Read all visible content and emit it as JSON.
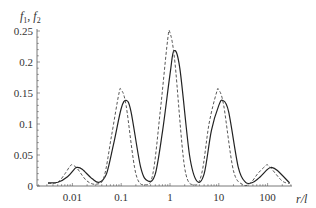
{
  "chart_data": {
    "type": "line",
    "title": "",
    "ylabel": "f1, f2",
    "ylabel_parts": {
      "a": "f",
      "a_sub": "1",
      "sep": ", ",
      "b": "f",
      "b_sub": "2"
    },
    "xlabel": "r/l",
    "xscale": "log",
    "xlim": [
      0.003,
      280
    ],
    "ylim": [
      0,
      0.25
    ],
    "grid": false,
    "legend": null,
    "x_ticks": [
      {
        "value": 0.01,
        "label": "0.01"
      },
      {
        "value": 0.1,
        "label": "0.1"
      },
      {
        "value": 1,
        "label": "1"
      },
      {
        "value": 10,
        "label": "10"
      },
      {
        "value": 100,
        "label": "100"
      }
    ],
    "y_ticks": [
      {
        "value": 0,
        "label": "0"
      },
      {
        "value": 0.05,
        "label": "0.05"
      },
      {
        "value": 0.1,
        "label": "0.1"
      },
      {
        "value": 0.15,
        "label": "0.15"
      },
      {
        "value": 0.2,
        "label": "0.2"
      },
      {
        "value": 0.25,
        "label": "0.25"
      }
    ],
    "series": [
      {
        "name": "f1",
        "style": "solid",
        "color": "#222222",
        "peaks": [
          {
            "r": 0.012,
            "value": 0.03
          },
          {
            "r": 0.13,
            "value": 0.138
          },
          {
            "r": 1.2,
            "value": 0.218
          },
          {
            "r": 12,
            "value": 0.138
          },
          {
            "r": 120,
            "value": 0.03
          }
        ],
        "x_log": [
          -2.5,
          -2.3,
          -2.1,
          -1.95,
          -1.9,
          -1.8,
          -1.6,
          -1.45,
          -1.3,
          -1.15,
          -1.0,
          -0.9,
          -0.8,
          -0.6,
          -0.45,
          -0.3,
          -0.15,
          0.0,
          0.08,
          0.2,
          0.4,
          0.55,
          0.7,
          0.85,
          1.0,
          1.08,
          1.2,
          1.4,
          1.55,
          1.7,
          1.85,
          2.0,
          2.08,
          2.2,
          2.45
        ],
        "y": [
          0.005,
          0.006,
          0.015,
          0.028,
          0.03,
          0.027,
          0.012,
          0.006,
          0.02,
          0.07,
          0.125,
          0.138,
          0.12,
          0.03,
          0.008,
          0.02,
          0.09,
          0.18,
          0.218,
          0.19,
          0.05,
          0.008,
          0.02,
          0.09,
          0.13,
          0.138,
          0.12,
          0.03,
          0.006,
          0.006,
          0.015,
          0.027,
          0.03,
          0.025,
          0.005
        ]
      },
      {
        "name": "f2",
        "style": "dashed",
        "color": "#444444",
        "peaks": [
          {
            "r": 0.01,
            "value": 0.034
          },
          {
            "r": 0.1,
            "value": 0.155
          },
          {
            "r": 1.0,
            "value": 0.247
          },
          {
            "r": 10,
            "value": 0.155
          },
          {
            "r": 100,
            "value": 0.034
          }
        ],
        "x_log": [
          -2.5,
          -2.3,
          -2.15,
          -2.05,
          -2.0,
          -1.9,
          -1.7,
          -1.5,
          -1.35,
          -1.2,
          -1.05,
          -1.0,
          -0.9,
          -0.7,
          -0.5,
          -0.35,
          -0.2,
          -0.05,
          0.0,
          0.1,
          0.3,
          0.5,
          0.65,
          0.8,
          0.95,
          1.0,
          1.1,
          1.3,
          1.5,
          1.65,
          1.8,
          1.95,
          2.0,
          2.1,
          2.3,
          2.45
        ],
        "y": [
          0.004,
          0.006,
          0.02,
          0.032,
          0.034,
          0.028,
          0.008,
          0.003,
          0.015,
          0.08,
          0.148,
          0.155,
          0.13,
          0.02,
          0.002,
          0.02,
          0.12,
          0.235,
          0.247,
          0.2,
          0.03,
          0.002,
          0.02,
          0.1,
          0.15,
          0.155,
          0.13,
          0.025,
          0.002,
          0.005,
          0.02,
          0.032,
          0.034,
          0.026,
          0.008,
          0.004
        ]
      }
    ]
  }
}
